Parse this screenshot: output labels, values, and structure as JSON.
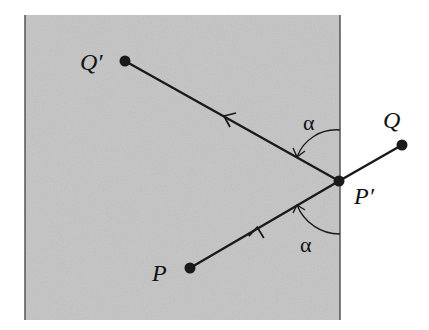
{
  "diagram": {
    "type": "reflection-geometry",
    "colors": {
      "region_fill": "#c4c4c4",
      "border": "#555555",
      "line": "#1a1a1a",
      "background": "#ffffff"
    },
    "labels": {
      "q_prime": "Q′",
      "q": "Q",
      "p_prime": "P′",
      "p": "P",
      "alpha_top": "α",
      "alpha_bottom": "α"
    },
    "points": {
      "Q_prime": [
        125,
        61
      ],
      "P_prime": [
        339,
        181
      ],
      "Q": [
        402,
        145
      ],
      "P": [
        190,
        268
      ]
    }
  }
}
